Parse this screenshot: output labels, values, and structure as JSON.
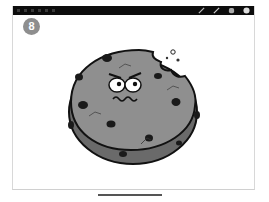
{
  "toolbar": {
    "icons": [
      "pen-icon",
      "pencil-icon",
      "eraser-icon",
      "color-icon"
    ]
  },
  "slide": {
    "badge_number": "8",
    "illustration": "cartoon cookie with bite and worried face",
    "colors": {
      "cookie_fill": "#8f8f8f",
      "cookie_edge": "#6a6a6a",
      "outline": "#111111",
      "badge": "#8e8e8e",
      "toolbar": "#0d0d0d"
    }
  }
}
